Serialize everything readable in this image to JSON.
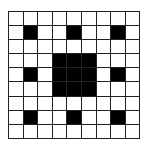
{
  "diagram": {
    "type": "sierpinski-carpet-grid",
    "rows": 9,
    "cols": 9,
    "fill_color": "#000000",
    "empty_color": "#ffffff",
    "line_color": "#222222",
    "filled": [
      [
        0,
        0,
        0,
        0,
        0,
        0,
        0,
        0,
        0
      ],
      [
        0,
        1,
        0,
        0,
        1,
        0,
        0,
        1,
        0
      ],
      [
        0,
        0,
        0,
        0,
        0,
        0,
        0,
        0,
        0
      ],
      [
        0,
        0,
        0,
        1,
        1,
        1,
        0,
        0,
        0
      ],
      [
        0,
        1,
        0,
        1,
        1,
        1,
        0,
        1,
        0
      ],
      [
        0,
        0,
        0,
        1,
        1,
        1,
        0,
        0,
        0
      ],
      [
        0,
        0,
        0,
        0,
        0,
        0,
        0,
        0,
        0
      ],
      [
        0,
        1,
        0,
        0,
        1,
        0,
        0,
        1,
        0
      ],
      [
        0,
        0,
        0,
        0,
        0,
        0,
        0,
        0,
        0
      ]
    ]
  }
}
